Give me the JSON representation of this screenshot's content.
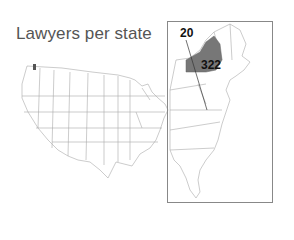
{
  "title": "Lawyers per state",
  "map": {
    "region": "Contiguous United States",
    "inset": "Northeast / East Coast",
    "highlighted_states": [
      {
        "name": "New York",
        "value": 322,
        "color": "#777777"
      },
      {
        "name": "District of Columbia",
        "value": 20,
        "color": "#777777"
      }
    ],
    "fill_color": "#ffffff",
    "border_color": "#999999"
  },
  "labels": {
    "dc_value": "20",
    "ny_value": "322"
  }
}
